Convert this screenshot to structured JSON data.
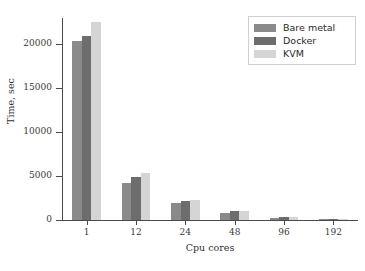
{
  "chart_data": {
    "type": "bar",
    "title": "",
    "subtitle": "",
    "xlabel": "Cpu cores",
    "ylabel": "Time, sec",
    "categories": [
      "1",
      "12",
      "24",
      "48",
      "96",
      "192"
    ],
    "series": [
      {
        "name": "Bare metal",
        "color": "#8a8a8a",
        "values": [
          20350,
          4200,
          1900,
          800,
          280,
          100
        ]
      },
      {
        "name": "Docker",
        "color": "#6d6d6d",
        "values": [
          20900,
          4900,
          2150,
          980,
          390,
          130
        ]
      },
      {
        "name": "KVM",
        "color": "#d5d5d5",
        "values": [
          22500,
          5350,
          2300,
          1050,
          370,
          120
        ]
      }
    ],
    "ylim": [
      0,
      23000
    ],
    "yticks": [
      0,
      5000,
      10000,
      15000,
      20000
    ],
    "ytick_labels": [
      "0",
      "5000",
      "10000",
      "15000",
      "20000"
    ],
    "grid": false,
    "legend_position": "top-right",
    "annotations": []
  },
  "legend": {
    "entries": [
      {
        "label": "Bare metal"
      },
      {
        "label": "Docker"
      },
      {
        "label": "KVM"
      }
    ]
  },
  "axes": {
    "y_title": "Time, sec",
    "x_title": "Cpu cores"
  }
}
